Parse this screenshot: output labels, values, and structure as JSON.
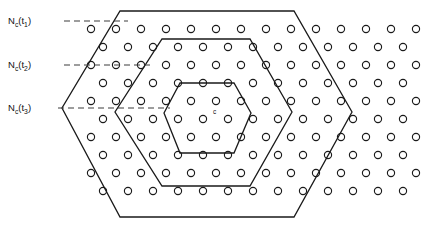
{
  "figure": {
    "background_color": "#ffffff",
    "line_color": "#1a1a1a",
    "dash_color": "#3c3c3c",
    "width": 432,
    "height": 232
  },
  "labels": {
    "tier1": {
      "base": "N",
      "sub_base": "c",
      "arg_open": "(t",
      "arg_sub": "1",
      "arg_close": ")",
      "text": "Nc(t1)"
    },
    "tier2": {
      "base": "N",
      "sub_base": "c",
      "arg_open": "(t",
      "arg_sub": "2",
      "arg_close": ")",
      "text": "Nc(t2)"
    },
    "tier3": {
      "base": "N",
      "sub_base": "c",
      "arg_open": "(t",
      "arg_sub": "3",
      "arg_close": ")",
      "text": "Nc(t3)"
    },
    "center_marker": "c"
  },
  "leaders": [
    {
      "name": "leader-t1",
      "x1": 64,
      "y1": 21,
      "x2": 128,
      "y2": 21
    },
    {
      "name": "leader-t2",
      "x1": 64,
      "y1": 65,
      "x2": 152,
      "y2": 65
    },
    {
      "name": "leader-t3",
      "x1": 58,
      "y1": 108,
      "x2": 170,
      "y2": 108
    }
  ],
  "label_positions": [
    {
      "name": "tier1-label",
      "x": 8,
      "y": 24
    },
    {
      "name": "tier2-label",
      "x": 8,
      "y": 68
    },
    {
      "name": "tier3-label",
      "x": 8,
      "y": 111
    }
  ],
  "hexagons": [
    {
      "name": "hex-outer-t1",
      "tier": "Nc(t1)",
      "center_x": 207,
      "center_y": 113,
      "points": "120,11 294,11 352,112 294,217 120,217 62,108"
    },
    {
      "name": "hex-middle-t2",
      "tier": "Nc(t2)",
      "center_x": 207,
      "center_y": 113,
      "points": "162,39 250,39 292,112 250,186 162,186 115,112"
    },
    {
      "name": "hex-inner-t3",
      "tier": "Nc(t3)",
      "center_x": 207,
      "center_y": 113,
      "points": "180,83 234,83 251,113 234,153 180,153 164,113"
    }
  ],
  "lattice": {
    "description": "Staggered circular cell-site markers",
    "dot_radius": 3.6,
    "row_spacing": 18,
    "col_spacing": 25,
    "rows": [
      {
        "y": 29,
        "x_start": 91,
        "count": 14
      },
      {
        "y": 47,
        "x_start": 103,
        "count": 14
      },
      {
        "y": 65,
        "x_start": 91,
        "count": 14
      },
      {
        "y": 83,
        "x_start": 103,
        "count": 14
      },
      {
        "y": 101,
        "x_start": 91,
        "count": 14
      },
      {
        "y": 119,
        "x_start": 103,
        "count": 14
      },
      {
        "y": 137,
        "x_start": 91,
        "count": 14
      },
      {
        "y": 155,
        "x_start": 103,
        "count": 14
      },
      {
        "y": 173,
        "x_start": 91,
        "count": 14
      },
      {
        "y": 191,
        "x_start": 103,
        "count": 14
      }
    ]
  },
  "center_dot": {
    "x": 207,
    "y": 119,
    "sup_x": 213,
    "sup_y": 114
  }
}
